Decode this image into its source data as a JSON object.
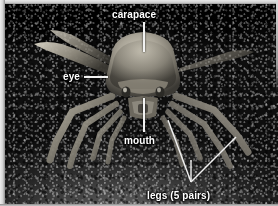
{
  "figure": {
    "kind": "labeled-photograph",
    "palette": {
      "label_text": "#ffffff",
      "leader_line": "#f2f2f2",
      "frame": "#e8e8e8",
      "background_dark": "#000000",
      "ground_mid": "#3a3a3a"
    }
  },
  "labels": {
    "carapace": {
      "text": "carapace",
      "x": 112,
      "y": 9,
      "leader": {
        "x": 143,
        "y": 22,
        "length": 30,
        "orientation": "vertical"
      }
    },
    "eye": {
      "text": "eye",
      "x": 63,
      "y": 71,
      "leader": {
        "x": 84,
        "y": 76,
        "length": 24,
        "orientation": "horizontal"
      }
    },
    "mouth": {
      "text": "mouth",
      "x": 124,
      "y": 135,
      "leader": {
        "x": 143,
        "y": 98,
        "length": 34,
        "orientation": "vertical"
      }
    },
    "legs": {
      "text": "legs (5 pairs)",
      "x": 147,
      "y": 190,
      "leader": {
        "orientation": "v-branch",
        "apex_x": 191,
        "apex_y": 182
      }
    }
  }
}
